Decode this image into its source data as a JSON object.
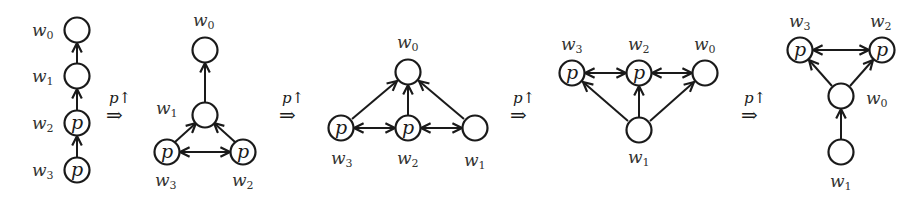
{
  "diagram": {
    "colors": {
      "stroke": "#1a1a1a",
      "label": "#333333",
      "background": "#ffffff"
    },
    "transition_label": "p↑",
    "transition_symbol": "⇒",
    "node_marker": "p",
    "panels": [
      {
        "id": 1,
        "nodes": [
          {
            "name": "w",
            "sub": "0",
            "marked": false
          },
          {
            "name": "w",
            "sub": "1",
            "marked": false
          },
          {
            "name": "w",
            "sub": "2",
            "marked": true
          },
          {
            "name": "w",
            "sub": "3",
            "marked": true
          }
        ],
        "edges": [
          "w3→w2",
          "w2→w1",
          "w1→w0"
        ]
      },
      {
        "id": 2,
        "nodes": [
          {
            "name": "w",
            "sub": "0",
            "marked": false
          },
          {
            "name": "w",
            "sub": "1",
            "marked": false
          },
          {
            "name": "w",
            "sub": "3",
            "marked": true
          },
          {
            "name": "w",
            "sub": "2",
            "marked": true
          }
        ],
        "edges": [
          "w1→w0",
          "w3→w1",
          "w2→w1",
          "w3↔w2"
        ]
      },
      {
        "id": 3,
        "nodes": [
          {
            "name": "w",
            "sub": "0",
            "marked": false
          },
          {
            "name": "w",
            "sub": "3",
            "marked": true
          },
          {
            "name": "w",
            "sub": "2",
            "marked": true
          },
          {
            "name": "w",
            "sub": "1",
            "marked": false
          }
        ],
        "edges": [
          "w3→w0",
          "w2→w0",
          "w1→w0",
          "w3↔w2",
          "w2↔w1"
        ]
      },
      {
        "id": 4,
        "nodes": [
          {
            "name": "w",
            "sub": "3",
            "marked": true
          },
          {
            "name": "w",
            "sub": "2",
            "marked": true
          },
          {
            "name": "w",
            "sub": "0",
            "marked": false
          },
          {
            "name": "w",
            "sub": "1",
            "marked": false
          }
        ],
        "edges": [
          "w1→w3",
          "w1→w2",
          "w1→w0",
          "w3↔w2",
          "w2↔w0"
        ]
      },
      {
        "id": 5,
        "nodes": [
          {
            "name": "w",
            "sub": "3",
            "marked": true
          },
          {
            "name": "w",
            "sub": "2",
            "marked": true
          },
          {
            "name": "w",
            "sub": "0",
            "marked": false
          },
          {
            "name": "w",
            "sub": "1",
            "marked": false
          }
        ],
        "edges": [
          "w0→w3",
          "w0→w2",
          "w1→w0",
          "w3↔w2"
        ]
      }
    ]
  }
}
